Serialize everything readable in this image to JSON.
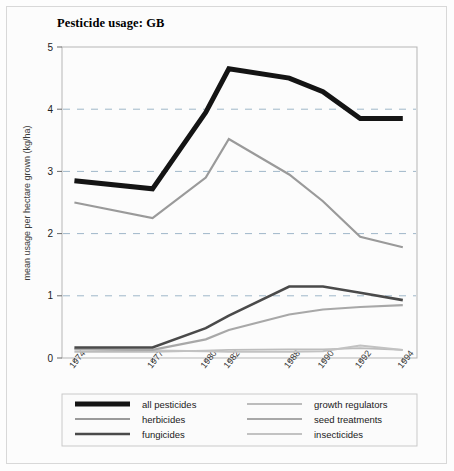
{
  "title": "Pesticide usage: GB",
  "axes": {
    "ylabel": "mean usage per hectare grown (kg/ha)",
    "yticks": [
      "0",
      "1",
      "2",
      "3",
      "4",
      "5"
    ],
    "xticks": [
      "1974",
      "1977",
      "1980",
      "1982",
      "1988",
      "1990",
      "1992",
      "1994"
    ]
  },
  "legend": {
    "entries": [
      {
        "label": "all pesticides",
        "color": "#141414",
        "width": 5.0
      },
      {
        "label": "herbicides",
        "color": "#9a9a9a",
        "width": 2.2
      },
      {
        "label": "fungicides",
        "color": "#4a4a4a",
        "width": 2.6
      },
      {
        "label": "growth regulators",
        "color": "#bcbcbc",
        "width": 1.8
      },
      {
        "label": "seed treatments",
        "color": "#a8a8a8",
        "width": 2.2
      },
      {
        "label": "insecticides",
        "color": "#c2c2c2",
        "width": 2.0
      }
    ]
  },
  "chart_data": {
    "type": "line",
    "title": "Pesticide usage: GB",
    "xlabel": "",
    "ylabel": "mean usage per hectare grown (kg/ha)",
    "categories": [
      "1974",
      "1977",
      "1980",
      "1982",
      "1988",
      "1990",
      "1992",
      "1994"
    ],
    "ylim": [
      0,
      5
    ],
    "yticks": [
      0,
      1,
      2,
      3,
      4,
      5
    ],
    "grid": "horizontal-dashed",
    "legend_position": "bottom",
    "series": [
      {
        "name": "all pesticides",
        "color": "#141414",
        "width": 5.0,
        "values": [
          2.85,
          2.72,
          3.95,
          4.65,
          4.5,
          4.28,
          3.85,
          3.85
        ]
      },
      {
        "name": "herbicides",
        "color": "#9a9a9a",
        "width": 2.2,
        "values": [
          2.5,
          2.25,
          2.9,
          3.52,
          2.95,
          2.52,
          1.95,
          1.78
        ]
      },
      {
        "name": "fungicides",
        "color": "#4a4a4a",
        "width": 2.6,
        "values": [
          0.17,
          0.17,
          0.48,
          0.68,
          1.15,
          1.15,
          1.05,
          0.93
        ]
      },
      {
        "name": "growth regulators",
        "color": "#bcbcbc",
        "width": 1.8,
        "values": [
          0.1,
          0.1,
          0.12,
          0.13,
          0.14,
          0.14,
          0.16,
          0.13
        ]
      },
      {
        "name": "seed treatments",
        "color": "#a8a8a8",
        "width": 2.2,
        "values": [
          0.14,
          0.13,
          0.3,
          0.45,
          0.7,
          0.78,
          0.82,
          0.85
        ]
      },
      {
        "name": "insecticides",
        "color": "#c2c2c2",
        "width": 2.0,
        "values": [
          0.15,
          0.12,
          0.11,
          0.1,
          0.1,
          0.11,
          0.2,
          0.13
        ]
      }
    ]
  }
}
